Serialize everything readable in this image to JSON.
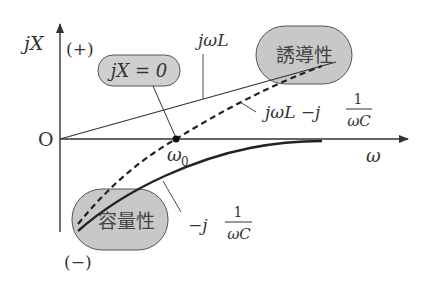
{
  "diagram": {
    "axes": {
      "y_label": "jX",
      "x_label": "ω",
      "origin_label": "O",
      "positive_label": "(+)",
      "negative_label": "(−)"
    },
    "curves": {
      "inductive": {
        "label": "jωL",
        "style": "solid-thin"
      },
      "capacitive": {
        "label_prefix": "−j",
        "label_num": "1",
        "label_den": "ωC",
        "style": "solid-thick"
      },
      "total": {
        "label_main": "jωL −j",
        "label_num": "1",
        "label_den": "ωC",
        "style": "dashed"
      }
    },
    "resonance": {
      "point_label": "ω",
      "point_sub": "0",
      "callout": "jX = 0"
    },
    "regions": {
      "inductive_region": "誘導性",
      "capacitive_region": "容量性"
    },
    "colors": {
      "line": "#333333",
      "region_fill": "#c8c8c8",
      "callout_fill": "#cfcfcf",
      "region_stroke": "#555555"
    }
  }
}
